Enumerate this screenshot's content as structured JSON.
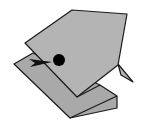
{
  "figure": {
    "colors": {
      "paper": "#b4b4b4",
      "outline": "#1a1a1a",
      "eye": "#000000",
      "background": "#ffffff"
    },
    "parts": [
      "lower-body-fold",
      "head-flap",
      "tail-fin",
      "eye",
      "mouth-arrow"
    ]
  }
}
